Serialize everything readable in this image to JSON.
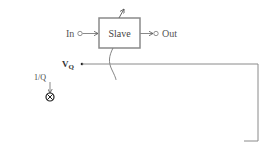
{
  "diagram": {
    "blocks": {
      "slave": {
        "label": "Slave"
      },
      "master": {
        "line1": "Q–tuning",
        "line2": "master"
      },
      "integrator": {
        "label": "Integrator"
      }
    },
    "ports": {
      "in": "In",
      "out": "Out"
    },
    "signals": {
      "vq_main": "V",
      "vq_sub": "Q",
      "inv_q": "1/Q",
      "v0_main": "V",
      "v0_sub": "0",
      "vref_main": "V",
      "vref_sub": "REF"
    },
    "operators": {
      "multiplier_symbol": "×",
      "summer_symbol": "Σ",
      "minus_sign": "-"
    },
    "colors": {
      "line_gray": "#8a8a8a",
      "box_black": "#1a1a1a",
      "text": "#333333"
    }
  }
}
